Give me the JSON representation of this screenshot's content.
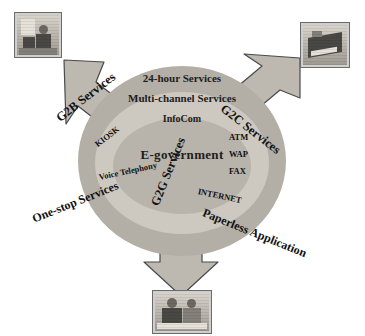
{
  "diagram": {
    "center": {
      "core_label": "E-government",
      "ring_labels": [
        "24-hour Services",
        "Multi-channel Services",
        "InfoCom"
      ],
      "channels": [
        "KIOSK",
        "Voice Telephony",
        "ATM",
        "WAP",
        "FAX",
        "INTERNET"
      ]
    },
    "arrows": [
      {
        "name": "g2b",
        "label": "G2B Services",
        "direction": "upper-left"
      },
      {
        "name": "g2c",
        "label": "G2C Services",
        "direction": "upper-right"
      },
      {
        "name": "g2g",
        "label": "G2G Services",
        "direction": "down"
      }
    ],
    "band_labels": [
      {
        "name": "one-stop",
        "label": "One-stop Services"
      },
      {
        "name": "paperless",
        "label": "Paperless Application"
      }
    ],
    "photos": [
      {
        "name": "citizen-office",
        "caption": "person working at a desk"
      },
      {
        "name": "business",
        "caption": "briefcase / business documents"
      },
      {
        "name": "government",
        "caption": "two government staff at a counter"
      }
    ],
    "colors": {
      "arrow_fill": "#bdb8b0",
      "arrow_stroke": "#4a4a4a",
      "ring_outer": "#b3aea6",
      "ring_mid": "#cdc8c0",
      "ring_inner": "#b8b3ab",
      "text": "#111111",
      "background": "#ffffff"
    }
  }
}
